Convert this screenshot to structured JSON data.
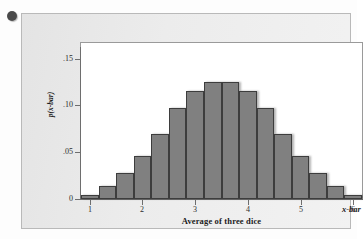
{
  "figure": {
    "bullet_marker": "bullet-dot"
  },
  "chart_data": {
    "type": "bar",
    "title": "",
    "xlabel": "Average of three dice",
    "ylabel": "p(x-bar)",
    "x_axis_variable_label": "x-bar",
    "categories": [
      "1",
      "1.333",
      "1.667",
      "2",
      "2.333",
      "2.667",
      "3",
      "3.333",
      "3.667",
      "4",
      "4.333",
      "4.667",
      "5",
      "5.333",
      "5.667",
      "6"
    ],
    "values": [
      0.0046,
      0.0139,
      0.0278,
      0.0463,
      0.0694,
      0.0972,
      0.1157,
      0.125,
      0.125,
      0.1157,
      0.0972,
      0.0694,
      0.0463,
      0.0278,
      0.0139,
      0.0046
    ],
    "xlim": [
      0.8333,
      6.1667
    ],
    "ylim": [
      0,
      0.1625
    ],
    "x_ticks": [
      "1",
      "2",
      "3",
      "4",
      "5",
      "6"
    ],
    "x_tick_values": [
      1,
      2,
      3,
      4,
      5,
      6
    ],
    "y_ticks": [
      "0",
      ".05",
      ".10",
      ".15"
    ],
    "y_tick_values": [
      0,
      0.05,
      0.1,
      0.15
    ],
    "grid": false,
    "legend": false,
    "bar_fill_color": "#808080",
    "bar_edge_color": "#3d3d3d",
    "plot_background": "#ffffff",
    "panel_background": "#ececec"
  }
}
